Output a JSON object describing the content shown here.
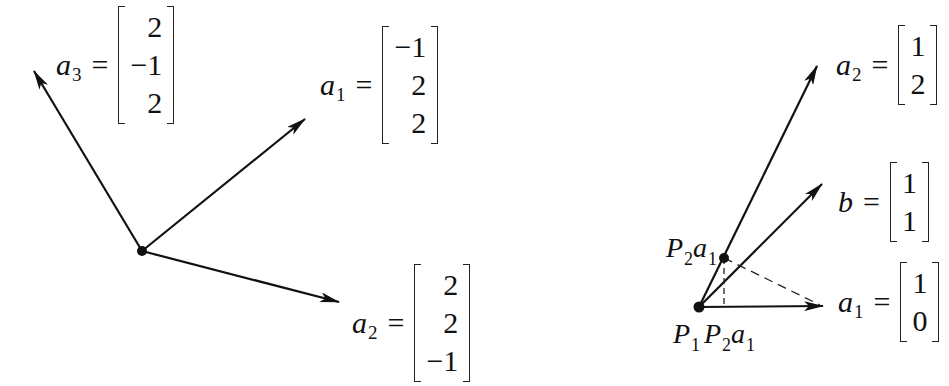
{
  "left_figure": {
    "origin": {
      "x": 142,
      "y": 251
    },
    "vectors": [
      {
        "name": "a",
        "index": "3",
        "tip": {
          "x": 33,
          "y": 70
        },
        "components": [
          "2",
          "−1",
          "2"
        ]
      },
      {
        "name": "a",
        "index": "1",
        "tip": {
          "x": 306,
          "y": 118
        },
        "components": [
          "−1",
          "2",
          "2"
        ]
      },
      {
        "name": "a",
        "index": "2",
        "tip": {
          "x": 340,
          "y": 302
        },
        "components": [
          "2",
          "2",
          "−1"
        ]
      }
    ],
    "equals": "="
  },
  "right_figure": {
    "origin": {
      "x": 699,
      "y": 307
    },
    "projection_point": {
      "x": 724,
      "y": 258
    },
    "vectors": [
      {
        "name": "a",
        "index": "2",
        "tip": {
          "x": 818,
          "y": 64
        },
        "components": [
          "1",
          "2"
        ]
      },
      {
        "name": "b",
        "index": "",
        "tip": {
          "x": 823,
          "y": 183
        },
        "components": [
          "1",
          "1"
        ]
      },
      {
        "name": "a",
        "index": "1",
        "tip": {
          "x": 824,
          "y": 306
        },
        "components": [
          "1",
          "0"
        ]
      }
    ],
    "point_labels": {
      "projection_top": {
        "P": "P",
        "P_index": "2",
        "a": "a",
        "a_index": "1"
      },
      "origin_left": {
        "P": "P",
        "P_index": "1"
      },
      "origin_right": {
        "P": "P",
        "P_index": "2",
        "a": "a",
        "a_index": "1"
      }
    },
    "equals": "="
  },
  "colors": {
    "ink": "#111111",
    "background": "#ffffff"
  }
}
